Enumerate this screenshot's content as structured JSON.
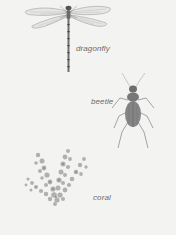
{
  "plate": {
    "background": "#f3f3f1",
    "specimens": [
      {
        "name": "dragonfly",
        "label": "dragonfly"
      },
      {
        "name": "beetle",
        "label": "beetle"
      },
      {
        "name": "coral",
        "label": "coral"
      }
    ]
  }
}
